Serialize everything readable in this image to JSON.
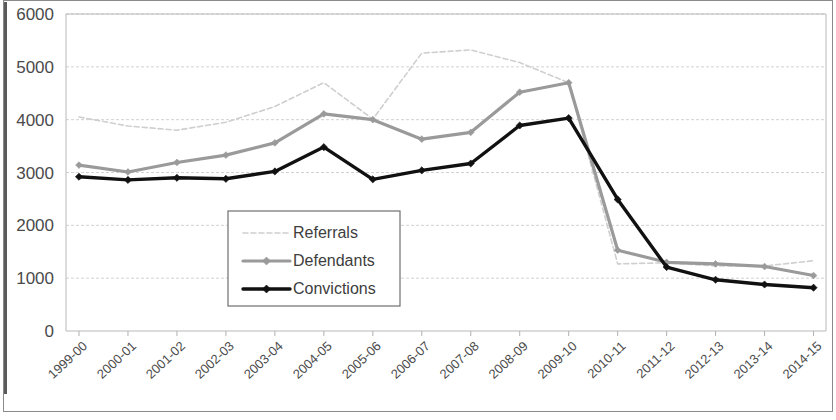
{
  "chart_data": {
    "type": "line",
    "title": "",
    "subtitle": "",
    "xlabel": "",
    "ylabel": "",
    "ylim": [
      0,
      6000
    ],
    "ytick_values": [
      0,
      1000,
      2000,
      3000,
      4000,
      5000,
      6000
    ],
    "ytick_labels": [
      "0",
      "1000",
      "2000",
      "3000",
      "4000",
      "5000",
      "6000"
    ],
    "grid": true,
    "legend_position": "center-left-inside",
    "categories": [
      "1999-00",
      "2000-01",
      "2001-02",
      "2002-03",
      "2003-04",
      "2004-05",
      "2005-06",
      "2006-07",
      "2007-08",
      "2008-09",
      "2009-10",
      "2010-11",
      "2011-12",
      "2012-13",
      "2013-14",
      "2014-15"
    ],
    "series": [
      {
        "name": "Referrals",
        "color": "#cfcfcf",
        "marker": "none",
        "values": [
          4050,
          3880,
          3800,
          3950,
          4250,
          4700,
          4010,
          5260,
          5320,
          5080,
          4700,
          1270,
          1290,
          1230,
          1230,
          1330
        ]
      },
      {
        "name": "Defendants",
        "color": "#9a9a9a",
        "marker": "diamond",
        "values": [
          3140,
          3010,
          3190,
          3330,
          3560,
          4110,
          4000,
          3630,
          3760,
          4520,
          4700,
          1530,
          1300,
          1270,
          1220,
          1050
        ]
      },
      {
        "name": "Convictions",
        "color": "#111111",
        "marker": "diamond",
        "values": [
          2920,
          2860,
          2900,
          2880,
          3020,
          3480,
          2870,
          3040,
          3170,
          3890,
          4030,
          2490,
          1210,
          970,
          880,
          820
        ]
      }
    ]
  },
  "legend": {
    "entries": [
      {
        "label": "Referrals"
      },
      {
        "label": "Defendants"
      },
      {
        "label": "Convictions"
      }
    ]
  }
}
